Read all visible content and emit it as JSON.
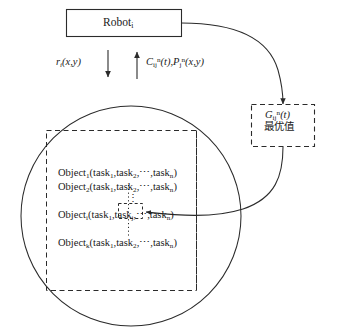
{
  "diagram": {
    "title_node": {
      "label": "Robot",
      "subscript": "i"
    },
    "flow_labels": {
      "down_arrow": {
        "base": "r",
        "subscript": "i",
        "args": "(x,y)"
      },
      "up_arrow": {
        "c_base": "C",
        "c_subscript": "ij",
        "c_superscript": "n",
        "c_args": "(t)",
        "separator": ",",
        "p_base": "P",
        "p_subscript": "j",
        "p_superscript": "n",
        "p_args": "(x,y)"
      }
    },
    "optimal_box": {
      "g_base": "G",
      "g_subscript": "ij",
      "g_superscript": "n",
      "g_args": "(t)",
      "chinese_label": "最优值"
    },
    "object_rows": [
      {
        "name": "Object",
        "subscript": "1",
        "open": "(",
        "task1": "task",
        "task1_sub": "1",
        "comma1": ",",
        "task2": "task",
        "task2_sub": "2",
        "comma2": ",",
        "ellipsis": "⋯",
        "comma3": ",",
        "taskn": "task",
        "taskn_sub": "n",
        "close": ")"
      },
      {
        "name": "Object",
        "subscript": "2",
        "open": "(",
        "task1": "task",
        "task1_sub": "1",
        "comma1": ",",
        "task2": "task",
        "task2_sub": "2",
        "comma2": ",",
        "ellipsis": "⋯",
        "comma3": ",",
        "taskn": "task",
        "taskn_sub": "n",
        "close": ")"
      },
      {
        "name": "Object",
        "subscript": "i",
        "open": "(",
        "task1": "task",
        "task1_sub": "1",
        "comma1": ",",
        "task2": "task",
        "task2_sub": "j",
        "comma2": ",",
        "ellipsis": "⋯",
        "comma3": ",",
        "taskn": "task",
        "taskn_sub": "n",
        "close": ")"
      },
      {
        "name": "Object",
        "subscript": "k",
        "open": "(",
        "task1": "task",
        "task1_sub": "1",
        "comma1": ",",
        "task2": "task",
        "task2_sub": "2",
        "comma2": ",",
        "ellipsis": "⋯",
        "comma3": ",",
        "taskn": "task",
        "taskn_sub": "n",
        "close": ")"
      }
    ],
    "vertical_ellipsis": "⋮",
    "colors": {
      "stroke": "#2b2b2b",
      "text": "#1a1a1a",
      "background": "#ffffff"
    }
  }
}
